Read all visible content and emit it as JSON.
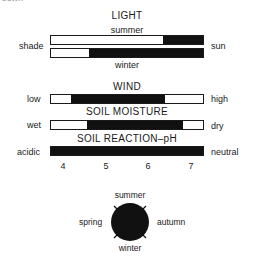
{
  "fragment_top": "sown",
  "light": {
    "title": "LIGHT",
    "summer_label": "summer",
    "winter_label": "winter",
    "left_label": "shade",
    "right_label": "sun",
    "summer_fill": {
      "start_pct": 74,
      "end_pct": 100
    },
    "winter_fill": {
      "start_pct": 25,
      "end_pct": 100
    }
  },
  "wind": {
    "title": "WIND",
    "left_label": "low",
    "right_label": "high",
    "fill": {
      "start_pct": 13,
      "end_pct": 75
    }
  },
  "soil_moisture": {
    "title": "SOIL MOISTURE",
    "left_label": "wet",
    "right_label": "dry",
    "fill": {
      "start_pct": 24,
      "end_pct": 87
    }
  },
  "soil_ph": {
    "title": "SOIL REACTION–pH",
    "left_label": "acidic",
    "right_label": "neutral",
    "fill": {
      "start_pct": 0,
      "end_pct": 100
    },
    "ticks": [
      "4",
      "5",
      "6",
      "7"
    ]
  },
  "seasons": {
    "top": "summer",
    "left": "spring",
    "right": "autumn",
    "bottom": "winter"
  },
  "colors": {
    "fill": "#111111",
    "outline": "#1a1a1a",
    "background": "#ffffff"
  }
}
